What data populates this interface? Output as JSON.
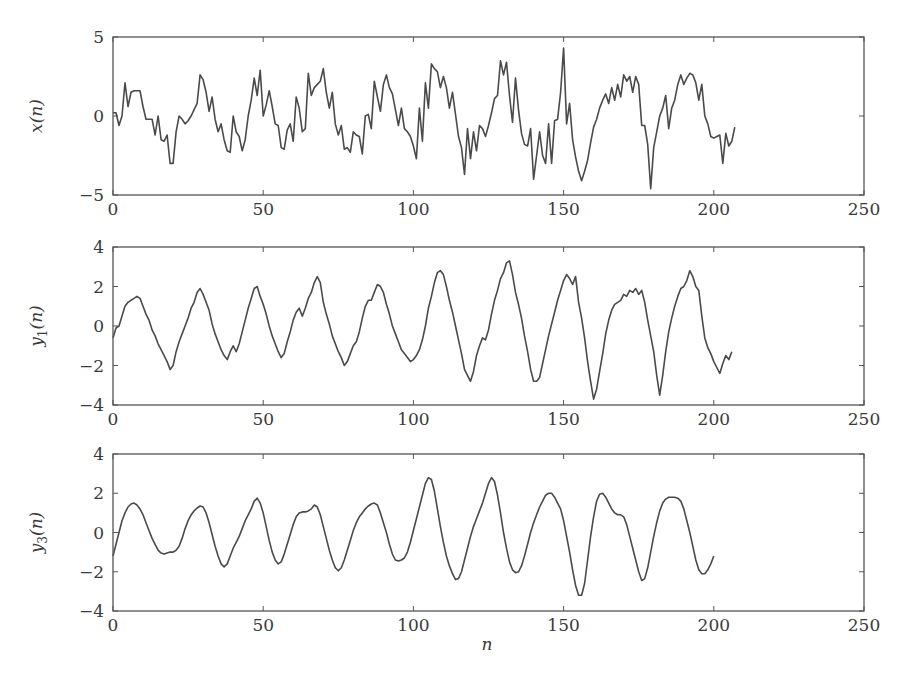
{
  "figure": {
    "xlabel": "n",
    "line_color": "#4a4a4a",
    "axis_color": "#555555"
  },
  "chart_data": [
    {
      "type": "line",
      "title": "",
      "xlabel": "",
      "ylabel": "x(n)",
      "ylabel_main": "x",
      "ylabel_sub": "",
      "xlim": [
        0,
        250
      ],
      "ylim": [
        -5,
        5
      ],
      "xticks": [
        0,
        50,
        100,
        150,
        200,
        250
      ],
      "xtick_labels": [
        "0",
        "50",
        "100",
        "150",
        "200",
        "250"
      ],
      "yticks": [
        -5,
        0,
        5
      ],
      "ytick_labels": [
        "−5",
        "0",
        "5"
      ],
      "grid": false,
      "box": {
        "left": 113,
        "right": 864,
        "top": 37,
        "bottom": 195
      },
      "series": [
        {
          "name": "x(n)",
          "x_start": 0,
          "values": [
            0.2,
            0.2,
            -0.6,
            0.0,
            2.1,
            0.6,
            1.5,
            1.6,
            1.6,
            1.6,
            0.6,
            -0.2,
            -0.2,
            -0.2,
            -1.2,
            0.0,
            -1.5,
            -1.6,
            -1.2,
            -3.0,
            -3.0,
            -1.0,
            0.0,
            -0.2,
            -0.5,
            -0.3,
            0.0,
            0.4,
            0.8,
            2.6,
            2.3,
            1.5,
            0.3,
            1.2,
            -0.2,
            -1.0,
            -0.5,
            -1.5,
            -2.2,
            -2.3,
            0.0,
            -1.0,
            -1.3,
            -2.2,
            -1.5,
            0.0,
            1.0,
            2.4,
            1.3,
            2.9,
            0.0,
            0.7,
            1.6,
            0.6,
            -0.5,
            -0.6,
            -2.0,
            -2.1,
            -0.9,
            -0.5,
            -1.6,
            1.2,
            0.5,
            -1.0,
            -0.8,
            2.7,
            1.3,
            1.8,
            2.0,
            2.2,
            3.0,
            1.5,
            0.5,
            1.5,
            -0.5,
            -1.2,
            -0.6,
            -2.1,
            -2.0,
            -2.3,
            -1.0,
            -1.2,
            -1.3,
            -2.4,
            0.0,
            0.1,
            -0.8,
            2.2,
            1.2,
            0.3,
            2.0,
            2.6,
            1.8,
            1.4,
            0.4,
            -0.6,
            0.5,
            -0.8,
            -1.0,
            -1.3,
            -1.9,
            -2.7,
            0.5,
            -1.6,
            2.1,
            0.5,
            3.3,
            3.0,
            2.8,
            1.8,
            2.5,
            1.8,
            0.5,
            1.5,
            0.1,
            -1.3,
            -2.0,
            -3.7,
            -0.8,
            -2.7,
            -1.0,
            -2.2,
            -0.6,
            -0.8,
            -1.3,
            -0.6,
            0.2,
            1.1,
            1.3,
            3.5,
            2.6,
            3.4,
            1.3,
            -0.4,
            2.4,
            0.4,
            -1.1,
            -1.8,
            -1.9,
            -0.8,
            -4.0,
            -2.5,
            -1.0,
            -2.5,
            -3.0,
            -0.5,
            -3.0,
            -0.3,
            -0.2,
            1.5,
            4.3,
            -0.5,
            0.8,
            -1.5,
            -2.6,
            -3.5,
            -4.1,
            -3.5,
            -2.8,
            -1.7,
            -0.7,
            -0.2,
            0.5,
            1.0,
            1.4,
            0.8,
            1.8,
            1.0,
            2.0,
            1.2,
            2.6,
            2.2,
            2.5,
            1.5,
            2.5,
            2.0,
            -0.6,
            -0.6,
            -1.8,
            -4.6,
            -2.0,
            -1.0,
            0.0,
            0.5,
            1.3,
            -0.8,
            0.5,
            1.0,
            2.0,
            2.6,
            2.0,
            2.4,
            2.7,
            2.6,
            2.1,
            1.0,
            2.0,
            0.0,
            -0.5,
            -1.3,
            -1.4,
            -1.3,
            -1.2,
            -3.0,
            -1.1,
            -1.9,
            -1.6,
            -0.7
          ]
        }
      ]
    },
    {
      "type": "line",
      "title": "",
      "xlabel": "",
      "ylabel": "y1(n)",
      "ylabel_main": "y",
      "ylabel_sub": "1",
      "xlim": [
        0,
        250
      ],
      "ylim": [
        -4,
        4
      ],
      "xticks": [
        0,
        50,
        100,
        150,
        200,
        250
      ],
      "xtick_labels": [
        "0",
        "50",
        "100",
        "150",
        "200",
        "250"
      ],
      "yticks": [
        -4,
        -2,
        0,
        2,
        4
      ],
      "ytick_labels": [
        "−4",
        "−2",
        "0",
        "2",
        "4"
      ],
      "grid": false,
      "box": {
        "left": 113,
        "right": 864,
        "top": 247,
        "bottom": 405
      },
      "series": [
        {
          "name": "y1(n)",
          "x_start": 0,
          "values": [
            -0.6,
            -0.1,
            0.0,
            0.5,
            1.0,
            1.2,
            1.3,
            1.4,
            1.5,
            1.4,
            1.0,
            0.6,
            0.3,
            -0.2,
            -0.5,
            -0.9,
            -1.2,
            -1.5,
            -1.8,
            -2.2,
            -2.0,
            -1.3,
            -0.8,
            -0.4,
            0.0,
            0.4,
            0.9,
            1.2,
            1.7,
            1.9,
            1.6,
            1.2,
            0.8,
            0.1,
            -0.4,
            -0.8,
            -1.2,
            -1.5,
            -1.7,
            -1.3,
            -1.0,
            -1.3,
            -0.9,
            -0.3,
            0.3,
            0.9,
            1.4,
            1.9,
            2.0,
            1.5,
            1.1,
            0.6,
            0.0,
            -0.5,
            -0.9,
            -1.3,
            -1.6,
            -1.4,
            -0.8,
            -0.3,
            0.3,
            0.7,
            0.9,
            0.5,
            0.9,
            1.4,
            1.7,
            2.2,
            2.5,
            2.2,
            1.2,
            0.6,
            0.1,
            -0.5,
            -0.9,
            -1.3,
            -1.6,
            -2.0,
            -1.8,
            -1.4,
            -1.0,
            -0.8,
            -0.3,
            0.4,
            1.0,
            1.3,
            1.3,
            1.7,
            2.1,
            2.0,
            1.7,
            1.1,
            0.6,
            0.0,
            -0.4,
            -0.8,
            -1.2,
            -1.4,
            -1.6,
            -1.8,
            -1.7,
            -1.5,
            -1.2,
            -0.7,
            0.0,
            0.9,
            1.5,
            2.2,
            2.7,
            2.8,
            2.6,
            2.0,
            1.3,
            0.7,
            0.0,
            -0.7,
            -1.4,
            -2.2,
            -2.5,
            -2.8,
            -2.3,
            -1.5,
            -1.0,
            -0.6,
            -0.7,
            -0.2,
            0.6,
            1.3,
            1.8,
            2.4,
            2.7,
            3.2,
            3.3,
            2.6,
            1.7,
            1.1,
            0.4,
            -0.5,
            -1.3,
            -2.2,
            -2.8,
            -2.8,
            -2.6,
            -1.9,
            -1.2,
            -0.5,
            0.1,
            0.7,
            1.3,
            1.8,
            2.3,
            2.6,
            2.4,
            2.1,
            2.5,
            1.2,
            0.4,
            -0.6,
            -1.8,
            -2.8,
            -3.7,
            -3.2,
            -2.3,
            -1.4,
            -0.4,
            0.3,
            0.8,
            1.1,
            1.2,
            1.3,
            1.6,
            1.5,
            1.8,
            1.7,
            1.9,
            1.6,
            1.8,
            1.2,
            0.3,
            -0.5,
            -1.3,
            -2.5,
            -3.5,
            -2.5,
            -1.3,
            -0.3,
            0.4,
            1.0,
            1.5,
            1.9,
            2.0,
            2.3,
            2.8,
            2.5,
            2.0,
            1.8,
            0.5,
            -0.6,
            -1.1,
            -1.4,
            -1.8,
            -2.1,
            -2.4,
            -1.9,
            -1.5,
            -1.7,
            -1.3
          ]
        }
      ]
    },
    {
      "type": "line",
      "title": "",
      "xlabel": "n",
      "ylabel": "y3(n)",
      "ylabel_main": "y",
      "ylabel_sub": "3",
      "xlim": [
        0,
        250
      ],
      "ylim": [
        -4,
        4
      ],
      "xticks": [
        0,
        50,
        100,
        150,
        200,
        250
      ],
      "xtick_labels": [
        "0",
        "50",
        "100",
        "150",
        "200",
        "250"
      ],
      "yticks": [
        -4,
        -2,
        0,
        2,
        4
      ],
      "ytick_labels": [
        "−4",
        "−2",
        "0",
        "2",
        "4"
      ],
      "grid": false,
      "box": {
        "left": 113,
        "right": 864,
        "top": 454,
        "bottom": 611
      },
      "series": [
        {
          "name": "y3(n)",
          "x_start": 0,
          "values": [
            -1.2,
            -0.6,
            0.0,
            0.6,
            1.0,
            1.3,
            1.45,
            1.5,
            1.4,
            1.2,
            0.9,
            0.5,
            0.1,
            -0.3,
            -0.6,
            -0.9,
            -1.05,
            -1.1,
            -1.05,
            -1.0,
            -1.0,
            -0.9,
            -0.7,
            -0.3,
            0.2,
            0.6,
            0.9,
            1.1,
            1.25,
            1.35,
            1.3,
            1.0,
            0.5,
            -0.1,
            -0.7,
            -1.2,
            -1.6,
            -1.75,
            -1.6,
            -1.2,
            -0.8,
            -0.5,
            -0.2,
            0.2,
            0.6,
            0.9,
            1.2,
            1.6,
            1.75,
            1.5,
            1.0,
            0.3,
            -0.4,
            -1.0,
            -1.4,
            -1.6,
            -1.5,
            -1.1,
            -0.6,
            -0.1,
            0.4,
            0.8,
            1.0,
            1.05,
            1.05,
            1.1,
            1.2,
            1.4,
            1.3,
            0.9,
            0.3,
            -0.3,
            -0.9,
            -1.4,
            -1.8,
            -1.95,
            -1.8,
            -1.4,
            -0.9,
            -0.4,
            0.1,
            0.5,
            0.8,
            1.0,
            1.2,
            1.35,
            1.45,
            1.5,
            1.4,
            1.0,
            0.5,
            0.0,
            -0.6,
            -1.1,
            -1.4,
            -1.45,
            -1.4,
            -1.3,
            -1.0,
            -0.5,
            0.1,
            0.7,
            1.3,
            1.9,
            2.5,
            2.8,
            2.7,
            2.1,
            1.2,
            0.3,
            -0.5,
            -1.2,
            -1.7,
            -2.1,
            -2.4,
            -2.35,
            -2.0,
            -1.4,
            -0.8,
            -0.2,
            0.3,
            0.7,
            1.1,
            1.5,
            2.0,
            2.5,
            2.8,
            2.6,
            1.9,
            1.0,
            0.0,
            -0.8,
            -1.5,
            -1.9,
            -2.05,
            -2.0,
            -1.7,
            -1.2,
            -0.6,
            0.0,
            0.5,
            0.9,
            1.3,
            1.6,
            1.9,
            2.0,
            2.0,
            1.8,
            1.5,
            1.2,
            0.6,
            -0.2,
            -1.0,
            -1.9,
            -2.7,
            -3.2,
            -3.2,
            -2.6,
            -1.4,
            -0.2,
            0.8,
            1.6,
            1.95,
            2.0,
            1.8,
            1.5,
            1.2,
            1.0,
            0.9,
            0.9,
            0.8,
            0.4,
            -0.2,
            -0.8,
            -1.4,
            -2.0,
            -2.45,
            -2.35,
            -1.8,
            -1.0,
            -0.2,
            0.5,
            1.1,
            1.5,
            1.7,
            1.8,
            1.8,
            1.8,
            1.75,
            1.6,
            1.2,
            0.6,
            0.0,
            -0.7,
            -1.4,
            -1.9,
            -2.1,
            -2.1,
            -1.9,
            -1.6,
            -1.2
          ]
        }
      ]
    }
  ]
}
